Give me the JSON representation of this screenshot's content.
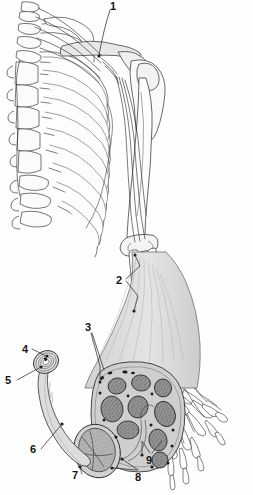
{
  "figure": {
    "type": "anatomical-line-illustration",
    "background_color": "#fefefe",
    "ink_color": "#1a1a1a",
    "fill_gray": "#d9d9d9",
    "fascicle_gray": "#8f8f8f",
    "epineurium_gray": "#cfcfcf"
  },
  "labels": [
    {
      "id": "1",
      "text": "1",
      "x": 110,
      "y": 1,
      "target": "brachial-plexus-roots"
    },
    {
      "id": "2",
      "text": "2",
      "x": 116,
      "y": 275,
      "target": "nerve-trunk-at-elbow"
    },
    {
      "id": "3",
      "text": "3",
      "x": 85,
      "y": 322,
      "target": "epineurium"
    },
    {
      "id": "4",
      "text": "4",
      "x": 22,
      "y": 344,
      "target": "myelinated-axon"
    },
    {
      "id": "5",
      "text": "5",
      "x": 5,
      "y": 375,
      "target": "myelin-sheath"
    },
    {
      "id": "6",
      "text": "6",
      "x": 30,
      "y": 444,
      "target": "nerve-fiber"
    },
    {
      "id": "7",
      "text": "7",
      "x": 72,
      "y": 470,
      "target": "perineurium"
    },
    {
      "id": "8",
      "text": "8",
      "x": 135,
      "y": 472,
      "target": "fascicle"
    },
    {
      "id": "9",
      "text": "9",
      "x": 146,
      "y": 455,
      "target": "endoneurium-vessels"
    }
  ],
  "structures": {
    "skeleton": "thoracic cage, vertebral column, clavicle, scapula, humerus, radius, ulna, carpals, metacarpals, phalanges",
    "nerve_overview": "brachial plexus descending as nerve trunk along the humerus to the hand",
    "cross_section": "magnified nerve trunk cross-section with multiple fascicles",
    "inset": "isolated nerve fiber with myelinated axon at cut end"
  }
}
